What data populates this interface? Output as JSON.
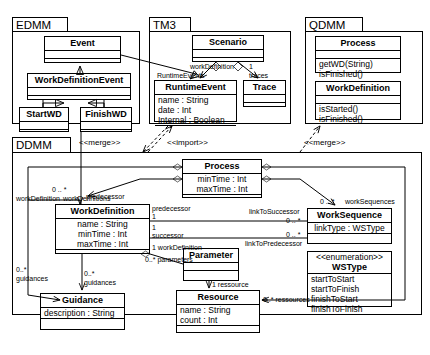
{
  "diagram": {
    "packages": [
      {
        "id": "edmm",
        "name": "EDMM",
        "classes": [
          {
            "id": "edmm-event",
            "name": "Event",
            "sections": [
              [],
              []
            ]
          },
          {
            "id": "edmm-wde",
            "name": "WorkDefinitionEvent",
            "sections": [
              [],
              []
            ]
          },
          {
            "id": "edmm-startwd",
            "name": "StartWD",
            "sections": [
              [],
              []
            ]
          },
          {
            "id": "edmm-finishwd",
            "name": "FinishWD",
            "sections": [
              [],
              []
            ]
          }
        ]
      },
      {
        "id": "tm3",
        "name": "TM3",
        "classes": [
          {
            "id": "tm3-scenario",
            "name": "Scenario",
            "sections": [
              [],
              []
            ]
          },
          {
            "id": "tm3-runtimeevent",
            "name": "RuntimeEvent",
            "sections": [
              [
                "name : String",
                "date : Int",
                "Internal : Boolean"
              ],
              []
            ]
          },
          {
            "id": "tm3-trace",
            "name": "Trace",
            "sections": [
              [],
              []
            ]
          }
        ]
      },
      {
        "id": "qdmm",
        "name": "QDMM",
        "classes": [
          {
            "id": "qdmm-process",
            "name": "Process",
            "sections": [
              [],
              [
                "getWD(String)",
                "isFinished()"
              ]
            ]
          },
          {
            "id": "qdmm-workdefinition",
            "name": "WorkDefinition",
            "sections": [
              [],
              [
                "isStarted()",
                "isFinished()"
              ]
            ]
          }
        ]
      },
      {
        "id": "ddmm",
        "name": "DDMM",
        "classes": [
          {
            "id": "ddmm-process",
            "name": "Process",
            "sections": [
              [
                "minTime : Int",
                "maxTime : Int"
              ],
              []
            ]
          },
          {
            "id": "ddmm-workdefinition",
            "name": "WorkDefinition",
            "sections": [
              [
                "name : String",
                "minTime : Int",
                "maxTime : Int"
              ],
              []
            ]
          },
          {
            "id": "ddmm-worksequence",
            "name": "WorkSequence",
            "sections": [
              [
                "linkType : WSType"
              ],
              []
            ]
          },
          {
            "id": "ddmm-wstype",
            "name": "WSType",
            "stereotype": "<<enumeration>>",
            "sections": [
              [
                "startToStart",
                "startToFinish",
                "finishToStart",
                "finishToFinish"
              ]
            ]
          },
          {
            "id": "ddmm-parameter",
            "name": "Parameter",
            "sections": [
              [],
              []
            ]
          },
          {
            "id": "ddmm-resource",
            "name": "Resource",
            "sections": [
              [
                "name : String",
                "count : Int"
              ],
              []
            ]
          },
          {
            "id": "ddmm-guidance",
            "name": "Guidance",
            "sections": [
              [
                "description : String"
              ],
              []
            ]
          }
        ]
      }
    ],
    "stereotype_labels": [
      {
        "id": "merge-1",
        "text": "<<merge>>"
      },
      {
        "id": "import-1",
        "text": "<<import>>"
      },
      {
        "id": "merge-2",
        "text": "<<merge>>"
      }
    ],
    "association_labels": [
      {
        "id": "lbl-runtimeevents",
        "text": "RuntimeEvents"
      },
      {
        "id": "lbl-traces",
        "text": "traces"
      },
      {
        "id": "lbl-mult-scen-re",
        "text": "0 .. *"
      },
      {
        "id": "lbl-mult-scen-tr",
        "text": "0 .. *"
      },
      {
        "id": "lbl-workdefinition-role",
        "text": "workDefinition"
      },
      {
        "id": "lbl-mult-wd-1",
        "text": "1"
      },
      {
        "id": "lbl-mult-wds",
        "text": "0 .. *"
      },
      {
        "id": "lbl-workdefinitions",
        "text": "workDefinitions"
      },
      {
        "id": "lbl-predecessor",
        "text": "predecessor"
      },
      {
        "id": "lbl-mult-pred-1",
        "text": "1"
      },
      {
        "id": "lbl-successor",
        "text": "successor"
      },
      {
        "id": "lbl-mult-succ-1",
        "text": "1"
      },
      {
        "id": "lbl-workdefinition-param",
        "text": "workDefinition"
      },
      {
        "id": "lbl-mult-wd-param-1",
        "text": "1"
      },
      {
        "id": "lbl-parameters",
        "text": "parameters"
      },
      {
        "id": "lbl-mult-params",
        "text": "0..*"
      },
      {
        "id": "lbl-linktosuccessor",
        "text": "linkToSuccessor"
      },
      {
        "id": "lbl-mult-lts",
        "text": "0 .. *"
      },
      {
        "id": "lbl-linktopredecessor",
        "text": "linkToPredecessor"
      },
      {
        "id": "lbl-mult-ltp",
        "text": "0 .. *"
      },
      {
        "id": "lbl-worksequences",
        "text": "workSequences"
      },
      {
        "id": "lbl-mult-ws",
        "text": "0 .. *"
      },
      {
        "id": "lbl-ressource",
        "text": "ressource"
      },
      {
        "id": "lbl-mult-res-1",
        "text": "1"
      },
      {
        "id": "lbl-ressources",
        "text": "ressources"
      },
      {
        "id": "lbl-mult-ress",
        "text": "0..*"
      },
      {
        "id": "lbl-guidances-left",
        "text": "guidances"
      },
      {
        "id": "lbl-mult-guid-left",
        "text": "0..*"
      },
      {
        "id": "lbl-guidances-mid",
        "text": "guidances"
      },
      {
        "id": "lbl-mult-guid-mid",
        "text": "0..*"
      }
    ]
  }
}
